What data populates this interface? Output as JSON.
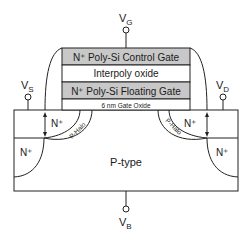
{
  "terminals": {
    "gate": {
      "main": "V",
      "sub": "G"
    },
    "source": {
      "main": "V",
      "sub": "S"
    },
    "drain": {
      "main": "V",
      "sub": "D"
    },
    "body": {
      "main": "V",
      "sub": "B"
    }
  },
  "gate_stack": {
    "control_gate": "N⁺ Poly-Si Control Gate",
    "interpoly": "Interpoly oxide",
    "floating_gate": "N⁺ Poly-Si Floating Gate",
    "gate_oxide": "6 nm Gate Oxide"
  },
  "regions": {
    "source_ext": "N⁺",
    "drain_ext": "N⁺",
    "source_deep": "N⁺",
    "drain_deep": "N⁺",
    "halo_left": "P-Halo",
    "halo_right": "P-Halo",
    "substrate": "P-type"
  },
  "colors": {
    "gate_fill": "#c8c8c8",
    "line": "#222222",
    "background": "#ffffff"
  }
}
